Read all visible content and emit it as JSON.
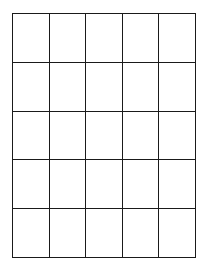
{
  "grid": {
    "rows": 5,
    "columns": 5,
    "line_color": "#1a1a1a",
    "background": "#ffffff",
    "cells": [
      [
        "",
        "",
        "",
        "",
        ""
      ],
      [
        "",
        "",
        "",
        "",
        ""
      ],
      [
        "",
        "",
        "",
        "",
        ""
      ],
      [
        "",
        "",
        "",
        "",
        ""
      ],
      [
        "",
        "",
        "",
        "",
        ""
      ]
    ]
  }
}
